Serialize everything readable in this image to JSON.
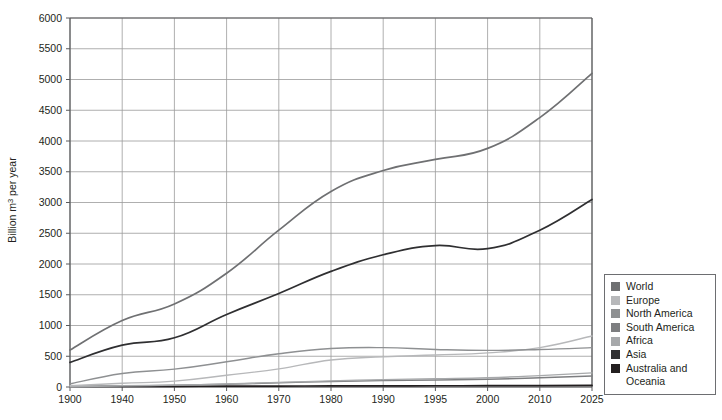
{
  "chart_data": {
    "type": "line",
    "title": "",
    "subtitle": "",
    "xlabel": "",
    "ylabel": "Billion m³ per year",
    "ylabel_parts": {
      "prefix": "Billion m",
      "sup": "3",
      "suffix": " per year"
    },
    "categories": [
      "1900",
      "1940",
      "1950",
      "1960",
      "1970",
      "1980",
      "1990",
      "1995",
      "2000",
      "2010",
      "2025"
    ],
    "x_tick_labels": [
      "1900",
      "1940",
      "1950",
      "1960",
      "1970",
      "1980",
      "1990",
      "1995",
      "2000",
      "2010",
      "2025"
    ],
    "y_tick_labels": [
      "0",
      "500",
      "1000",
      "1500",
      "2000",
      "2500",
      "3000",
      "3500",
      "4000",
      "4500",
      "5000",
      "5500",
      "6000"
    ],
    "y_ticks": [
      0,
      500,
      1000,
      1500,
      2000,
      2500,
      3000,
      3500,
      4000,
      4500,
      5000,
      5500,
      6000
    ],
    "ylim": [
      0,
      6000
    ],
    "grid": true,
    "grid_color": "#9a9a9a",
    "axis_color": "#58595b",
    "plot_background": "#ffffff",
    "legend_position": "right-bottom",
    "series": [
      {
        "name": "World",
        "color": "#6f7072",
        "values": [
          600,
          1080,
          1350,
          1850,
          2550,
          3180,
          3520,
          3700,
          3880,
          4380,
          5100
        ]
      },
      {
        "name": "Europe",
        "color": "#b7b8ba",
        "values": [
          20,
          60,
          95,
          190,
          295,
          440,
          490,
          520,
          555,
          640,
          830
        ]
      },
      {
        "name": "North America",
        "color": "#8e9092",
        "values": [
          50,
          220,
          290,
          410,
          540,
          625,
          640,
          610,
          595,
          610,
          640
        ]
      },
      {
        "name": "South America",
        "color": "#7d7e80",
        "values": [
          5,
          18,
          28,
          45,
          68,
          90,
          105,
          115,
          125,
          150,
          180
        ]
      },
      {
        "name": "Africa",
        "color": "#a7a9ab",
        "values": [
          5,
          20,
          30,
          50,
          75,
          100,
          120,
          135,
          150,
          185,
          230
        ]
      },
      {
        "name": "Asia",
        "color": "#2f2f31",
        "values": [
          400,
          680,
          800,
          1180,
          1520,
          1880,
          2150,
          2300,
          2250,
          2550,
          3050
        ]
      },
      {
        "name": "Australia and Oceania",
        "color": "#231f20",
        "values": [
          8,
          10,
          11,
          13,
          15,
          17,
          19,
          20,
          21,
          23,
          25
        ]
      }
    ],
    "legend_entries": [
      {
        "label": "World",
        "color": "#6f7072"
      },
      {
        "label": "Europe",
        "color": "#b7b8ba"
      },
      {
        "label": "North America",
        "color": "#8e9092"
      },
      {
        "label": "South America",
        "color": "#7d7e80"
      },
      {
        "label": "Africa",
        "color": "#a7a9ab"
      },
      {
        "label": "Asia",
        "color": "#2f2f31"
      },
      {
        "label": "Australia and",
        "color": "#231f20"
      }
    ],
    "legend_continuation": "Oceania"
  }
}
